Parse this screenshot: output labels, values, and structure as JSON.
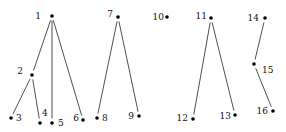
{
  "diagram": {
    "type": "forest",
    "nodes": [
      {
        "id": "1",
        "x": 52,
        "y": 16,
        "lx": 41,
        "ly": 19,
        "anchor": "end"
      },
      {
        "id": "2",
        "x": 32,
        "y": 75,
        "lx": 23,
        "ly": 74,
        "anchor": "end"
      },
      {
        "id": "3",
        "x": 11,
        "y": 118,
        "lx": 16,
        "ly": 121,
        "anchor": "start"
      },
      {
        "id": "4",
        "x": 40,
        "y": 123,
        "lx": 42,
        "ly": 116,
        "anchor": "start"
      },
      {
        "id": "5",
        "x": 52,
        "y": 123,
        "lx": 58,
        "ly": 126,
        "anchor": "start"
      },
      {
        "id": "6",
        "x": 83,
        "y": 120,
        "lx": 79,
        "ly": 121,
        "anchor": "end"
      },
      {
        "id": "7",
        "x": 118,
        "y": 17,
        "lx": 113,
        "ly": 17,
        "anchor": "end"
      },
      {
        "id": "8",
        "x": 97,
        "y": 118,
        "lx": 102,
        "ly": 121,
        "anchor": "start"
      },
      {
        "id": "9",
        "x": 139,
        "y": 116,
        "lx": 134,
        "ly": 119,
        "anchor": "end"
      },
      {
        "id": "10",
        "x": 167,
        "y": 17,
        "lx": 164,
        "ly": 20,
        "anchor": "end"
      },
      {
        "id": "11",
        "x": 211,
        "y": 18,
        "lx": 207,
        "ly": 19,
        "anchor": "end"
      },
      {
        "id": "12",
        "x": 193,
        "y": 119,
        "lx": 188,
        "ly": 121,
        "anchor": "end"
      },
      {
        "id": "13",
        "x": 235,
        "y": 115,
        "lx": 231,
        "ly": 119,
        "anchor": "end"
      },
      {
        "id": "14",
        "x": 265,
        "y": 18,
        "lx": 259,
        "ly": 21,
        "anchor": "end"
      },
      {
        "id": "15",
        "x": 254,
        "y": 64,
        "lx": 262,
        "ly": 73,
        "anchor": "start"
      },
      {
        "id": "16",
        "x": 273,
        "y": 111,
        "lx": 268,
        "ly": 114,
        "anchor": "end"
      }
    ],
    "edges": [
      [
        "1",
        "2"
      ],
      [
        "1",
        "5"
      ],
      [
        "1",
        "6"
      ],
      [
        "2",
        "3"
      ],
      [
        "2",
        "4"
      ],
      [
        "7",
        "8"
      ],
      [
        "7",
        "9"
      ],
      [
        "11",
        "12"
      ],
      [
        "11",
        "13"
      ],
      [
        "14",
        "15"
      ],
      [
        "15",
        "16"
      ]
    ]
  }
}
